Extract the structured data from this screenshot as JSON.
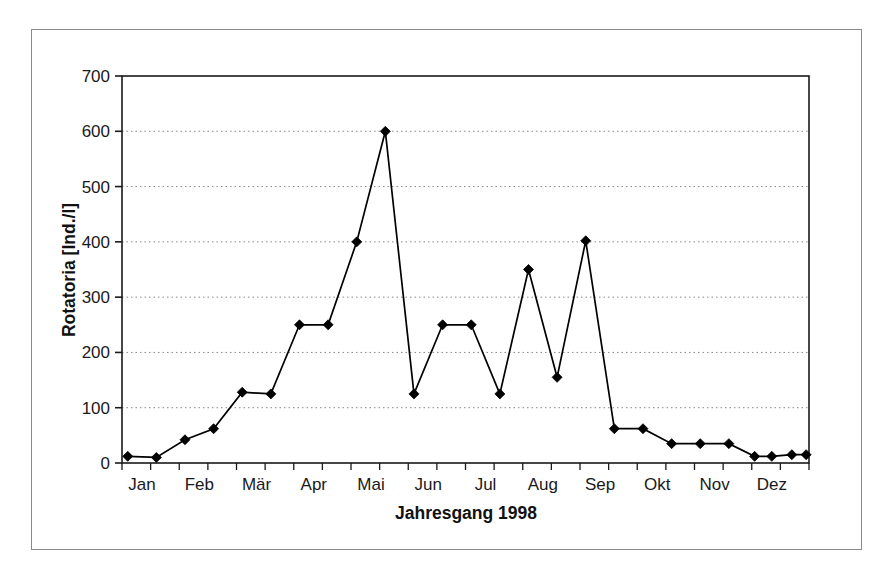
{
  "figure": {
    "background_color": "#ffffff",
    "frame_color": "#8a8a8a",
    "line_color": "#000000",
    "marker_color": "#000000",
    "gridline_color": "#888888"
  },
  "axes": {
    "y_title": "Rotatoria [Ind./l]",
    "x_title": "Jahresgang 1998",
    "y_ticks": [
      "0",
      "100",
      "200",
      "300",
      "400",
      "500",
      "600",
      "700"
    ],
    "x_ticks": [
      "Jan",
      "Feb",
      "Mär",
      "Apr",
      "Mai",
      "Jun",
      "Jul",
      "Aug",
      "Sep",
      "Okt",
      "Nov",
      "Dez"
    ]
  },
  "chart_data": {
    "type": "line",
    "title": "",
    "subtitle": "",
    "xlabel": "Jahresgang 1998",
    "ylabel": "Rotatoria [Ind./l]",
    "ylim": [
      0,
      700
    ],
    "ytick_values": [
      0,
      100,
      200,
      300,
      400,
      500,
      600,
      700
    ],
    "grid": "horizontal-dotted",
    "legend": "none",
    "marker": "filled-diamond",
    "categories": [
      "Jan",
      "Feb",
      "Mär",
      "Apr",
      "Mai",
      "Jun",
      "Jul",
      "Aug",
      "Sep",
      "Okt",
      "Nov",
      "Dez"
    ],
    "x_axis_note": "Month tick labels placed under every second sample; samples taken approximately twice per month",
    "series": [
      {
        "name": "Rotatoria",
        "x": [
          0.1,
          0.6,
          1.1,
          1.6,
          2.1,
          2.6,
          3.1,
          3.6,
          4.1,
          4.6,
          5.1,
          5.6,
          6.1,
          6.6,
          7.1,
          7.6,
          8.1,
          8.6,
          9.1,
          9.6,
          10.1,
          10.6,
          11.05,
          11.35,
          11.7,
          11.95
        ],
        "values": [
          12,
          10,
          42,
          62,
          128,
          125,
          250,
          250,
          400,
          600,
          125,
          250,
          250,
          125,
          350,
          155,
          402,
          62,
          62,
          35,
          35,
          35,
          12,
          12,
          15,
          15
        ]
      }
    ]
  }
}
